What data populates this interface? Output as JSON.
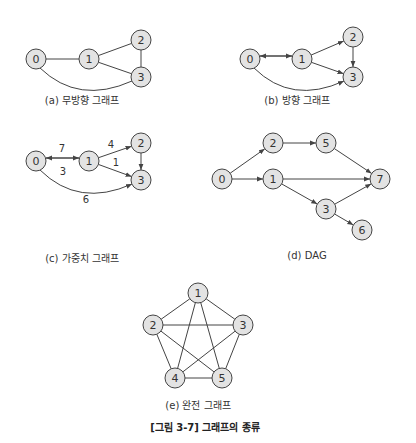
{
  "figure_title": "[그림 3-7] 그래프의 종류",
  "colors": {
    "node_fill": "#e3e3e3",
    "node_stroke": "#444444",
    "edge": "#444444",
    "text": "#333333"
  },
  "graphs": [
    {
      "id": "a",
      "caption": "(a) 무방향 그래프",
      "directed": false,
      "nodes": [
        {
          "id": "0",
          "x": 36,
          "y": 59
        },
        {
          "id": "1",
          "x": 89,
          "y": 59
        },
        {
          "id": "2",
          "x": 141,
          "y": 40
        },
        {
          "id": "3",
          "x": 141,
          "y": 77
        }
      ],
      "edges": [
        {
          "from": "0",
          "to": "1"
        },
        {
          "from": "1",
          "to": "2"
        },
        {
          "from": "1",
          "to": "3"
        },
        {
          "from": "2",
          "to": "3"
        },
        {
          "from": "0",
          "to": "3",
          "curve": true
        }
      ]
    },
    {
      "id": "b",
      "caption": "(b) 방향 그래프",
      "directed": true,
      "nodes": [
        {
          "id": "0",
          "x": 250,
          "y": 59
        },
        {
          "id": "1",
          "x": 302,
          "y": 59
        },
        {
          "id": "2",
          "x": 353,
          "y": 37
        },
        {
          "id": "3",
          "x": 353,
          "y": 77
        }
      ],
      "edges": [
        {
          "from": "0",
          "to": "1"
        },
        {
          "from": "1",
          "to": "0"
        },
        {
          "from": "1",
          "to": "2"
        },
        {
          "from": "1",
          "to": "3"
        },
        {
          "from": "2",
          "to": "3"
        },
        {
          "from": "0",
          "to": "3",
          "curve": true
        }
      ]
    },
    {
      "id": "c",
      "caption": "(c) 가중치 그래프",
      "directed": true,
      "nodes": [
        {
          "id": "0",
          "x": 36,
          "y": 161
        },
        {
          "id": "1",
          "x": 89,
          "y": 161
        },
        {
          "id": "2",
          "x": 141,
          "y": 143
        },
        {
          "id": "3",
          "x": 141,
          "y": 180
        }
      ],
      "edges": [
        {
          "from": "0",
          "to": "1",
          "weight": 7
        },
        {
          "from": "1",
          "to": "0",
          "weight": 3
        },
        {
          "from": "1",
          "to": "2",
          "weight": 4
        },
        {
          "from": "1",
          "to": "3",
          "weight": 1
        },
        {
          "from": "2",
          "to": "3"
        },
        {
          "from": "0",
          "to": "3",
          "weight": 6,
          "curve": true
        }
      ]
    },
    {
      "id": "d",
      "caption": "(d) DAG",
      "directed": true,
      "nodes": [
        {
          "id": "0",
          "x": 222,
          "y": 179
        },
        {
          "id": "2",
          "x": 273,
          "y": 143
        },
        {
          "id": "5",
          "x": 326,
          "y": 143
        },
        {
          "id": "1",
          "x": 273,
          "y": 179
        },
        {
          "id": "7",
          "x": 380,
          "y": 179
        },
        {
          "id": "3",
          "x": 326,
          "y": 209
        },
        {
          "id": "6",
          "x": 362,
          "y": 230
        }
      ],
      "edges": [
        {
          "from": "0",
          "to": "2"
        },
        {
          "from": "0",
          "to": "1"
        },
        {
          "from": "2",
          "to": "5"
        },
        {
          "from": "5",
          "to": "7"
        },
        {
          "from": "1",
          "to": "7"
        },
        {
          "from": "1",
          "to": "3"
        },
        {
          "from": "3",
          "to": "7"
        },
        {
          "from": "3",
          "to": "6"
        }
      ]
    },
    {
      "id": "e",
      "caption": "(e) 완전 그래프",
      "directed": false,
      "nodes": [
        {
          "id": "1",
          "x": 198,
          "y": 293
        },
        {
          "id": "2",
          "x": 153,
          "y": 325
        },
        {
          "id": "3",
          "x": 243,
          "y": 325
        },
        {
          "id": "4",
          "x": 175,
          "y": 378
        },
        {
          "id": "5",
          "x": 222,
          "y": 378
        }
      ],
      "edges": [
        {
          "from": "1",
          "to": "2"
        },
        {
          "from": "1",
          "to": "3"
        },
        {
          "from": "1",
          "to": "4"
        },
        {
          "from": "1",
          "to": "5"
        },
        {
          "from": "2",
          "to": "3"
        },
        {
          "from": "2",
          "to": "4"
        },
        {
          "from": "2",
          "to": "5"
        },
        {
          "from": "3",
          "to": "4"
        },
        {
          "from": "3",
          "to": "5"
        },
        {
          "from": "4",
          "to": "5"
        }
      ]
    }
  ],
  "captions_pos": {
    "a": {
      "x": 82,
      "y": 98
    },
    "b": {
      "x": 297,
      "y": 98
    },
    "c": {
      "x": 82,
      "y": 256
    },
    "d": {
      "x": 307,
      "y": 256
    },
    "e": {
      "x": 198,
      "y": 403
    },
    "title": {
      "x": 205,
      "y": 425
    }
  },
  "weight_labels": [
    {
      "text": "7",
      "x": 62,
      "y": 152
    },
    {
      "text": "3",
      "x": 63,
      "y": 175
    },
    {
      "text": "4",
      "x": 111,
      "y": 148
    },
    {
      "text": "1",
      "x": 116,
      "y": 166
    },
    {
      "text": "6",
      "x": 86,
      "y": 203
    }
  ]
}
